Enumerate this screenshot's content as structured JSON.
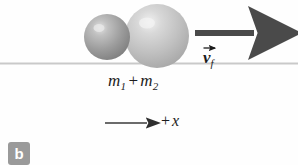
{
  "figure": {
    "panel_label": "b",
    "background_color": "#fefefe",
    "ground_line_color": "#c9c9c9"
  },
  "labels": {
    "mass_combined": {
      "m1": "m",
      "m1_sub": "1",
      "plus": "+",
      "m2": "m",
      "m2_sub": "2"
    },
    "velocity_final": {
      "symbol": "v",
      "subscript": "f"
    },
    "axis": {
      "plus": "+",
      "variable": "x"
    }
  },
  "objects": {
    "small_sphere": {
      "cx": 107,
      "cy": 37,
      "r": 23,
      "fill": "#9b9b9b",
      "highlight": "#d8d8d8"
    },
    "large_sphere": {
      "cx": 157,
      "cy": 36,
      "r": 32,
      "fill": "#c2c2c2",
      "highlight": "#e8e8e8"
    },
    "velocity_arrow": {
      "x1": 195,
      "x2": 262,
      "y": 33,
      "color": "#4a4a4a"
    },
    "axis_arrow": {
      "x1": 105,
      "x2": 155,
      "y": 123,
      "color": "#3a3a3a"
    },
    "ground_line": {
      "y": 63
    }
  }
}
